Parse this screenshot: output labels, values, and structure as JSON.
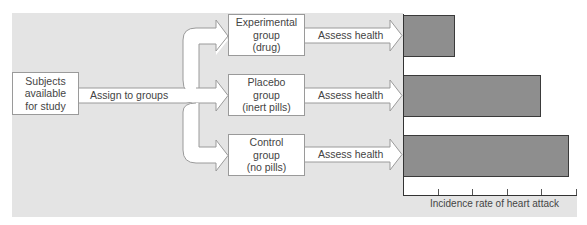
{
  "diagram": {
    "source": {
      "lines": [
        "Subjects",
        "available",
        "for study"
      ]
    },
    "assign_label": "Assign to groups",
    "groups": [
      {
        "id": "experimental",
        "lines": [
          "Experimental",
          "group",
          "(drug)"
        ],
        "arrow_label": "Assess health"
      },
      {
        "id": "placebo",
        "lines": [
          "Placebo",
          "group",
          "(inert pills)"
        ],
        "arrow_label": "Assess health"
      },
      {
        "id": "control",
        "lines": [
          "Control",
          "group",
          "(no pills)"
        ],
        "arrow_label": "Assess health"
      }
    ]
  },
  "chart_data": {
    "type": "bar",
    "orientation": "horizontal",
    "categories": [
      "Experimental group (drug)",
      "Placebo group (inert pills)",
      "Control group (no pills)"
    ],
    "values": [
      1.5,
      4.0,
      4.8
    ],
    "title": "",
    "xlabel": "Incidence rate of heart attack",
    "ylabel": "",
    "xlim": [
      0,
      5
    ],
    "tick_count": 5,
    "tick_labels_shown": false,
    "grid": false,
    "bar_color": "#8e8e8e"
  },
  "colors": {
    "panel_background": "#e4e4e4",
    "box_fill": "#ffffff",
    "bar_fill": "#8e8e8e",
    "bar_border": "#3a3a3a"
  }
}
